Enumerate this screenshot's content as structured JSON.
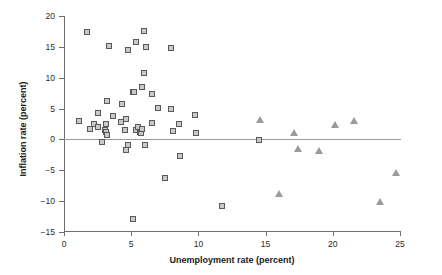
{
  "chart_data": {
    "type": "scatter",
    "title": "",
    "xlabel": "Unemployment rate (percent)",
    "ylabel": "Inflation rate (percent)",
    "xlim": [
      0,
      25
    ],
    "ylim": [
      -15,
      20
    ],
    "xticks": [
      0,
      5,
      10,
      15,
      20,
      25
    ],
    "yticks": [
      -15,
      -10,
      -5,
      0,
      5,
      10,
      15,
      20
    ],
    "xtick_labels": [
      "0",
      "5",
      "10",
      "15",
      "20",
      "25"
    ],
    "ytick_labels": [
      "−15",
      "−10",
      "−5",
      "0",
      "5",
      "10",
      "15",
      "20"
    ],
    "grid": false,
    "legend": "none",
    "reference_lines": [
      {
        "name": "zero-inflation-line",
        "axis": "y",
        "value": 0,
        "color": "#9a9a9a"
      }
    ],
    "series": [
      {
        "name": "squares",
        "marker": "square",
        "fill_color": "#c9c9cc",
        "edge_color": "#58585a",
        "points": [
          [
            1.8,
            17.2
          ],
          [
            3.4,
            14.9
          ],
          [
            4.8,
            14.4
          ],
          [
            5.4,
            15.6
          ],
          [
            6.0,
            17.4
          ],
          [
            6.2,
            14.8
          ],
          [
            8.0,
            14.7
          ],
          [
            6.0,
            10.6
          ],
          [
            5.2,
            7.5
          ],
          [
            5.3,
            7.6
          ],
          [
            5.9,
            8.3
          ],
          [
            6.6,
            7.2
          ],
          [
            3.3,
            6.0
          ],
          [
            4.4,
            5.5
          ],
          [
            7.1,
            4.9
          ],
          [
            8.0,
            4.7
          ],
          [
            2.6,
            4.1
          ],
          [
            3.7,
            3.7
          ],
          [
            1.2,
            2.8
          ],
          [
            2.3,
            2.3
          ],
          [
            2.0,
            1.5
          ],
          [
            2.6,
            1.9
          ],
          [
            3.1,
            1.4
          ],
          [
            3.2,
            2.4
          ],
          [
            3.2,
            1.0
          ],
          [
            3.3,
            0.6
          ],
          [
            4.3,
            2.6
          ],
          [
            4.7,
            3.2
          ],
          [
            4.6,
            1.3
          ],
          [
            5.4,
            1.4
          ],
          [
            5.6,
            1.9
          ],
          [
            5.7,
            1.1
          ],
          [
            5.8,
            0.8
          ],
          [
            5.9,
            1.6
          ],
          [
            6.6,
            2.5
          ],
          [
            8.6,
            2.4
          ],
          [
            8.2,
            1.2
          ],
          [
            9.8,
            3.8
          ],
          [
            9.9,
            0.9
          ],
          [
            2.9,
            -0.6
          ],
          [
            4.7,
            -1.9
          ],
          [
            4.8,
            -1.1
          ],
          [
            6.1,
            -1.0
          ],
          [
            8.7,
            -2.8
          ],
          [
            7.6,
            -6.4
          ],
          [
            11.8,
            -11.0
          ],
          [
            5.2,
            -13.0
          ],
          [
            14.6,
            -0.2
          ]
        ]
      },
      {
        "name": "triangles",
        "marker": "triangle",
        "fill_color": "#9a9a9e",
        "edge_color": "#7a7a7e",
        "points": [
          [
            14.6,
            3.2
          ],
          [
            17.1,
            1.0
          ],
          [
            17.4,
            -1.5
          ],
          [
            19.0,
            -1.8
          ],
          [
            20.2,
            2.3
          ],
          [
            21.6,
            3.0
          ],
          [
            16.0,
            -8.9
          ],
          [
            23.5,
            -10.2
          ],
          [
            24.7,
            -5.4
          ]
        ]
      }
    ]
  }
}
